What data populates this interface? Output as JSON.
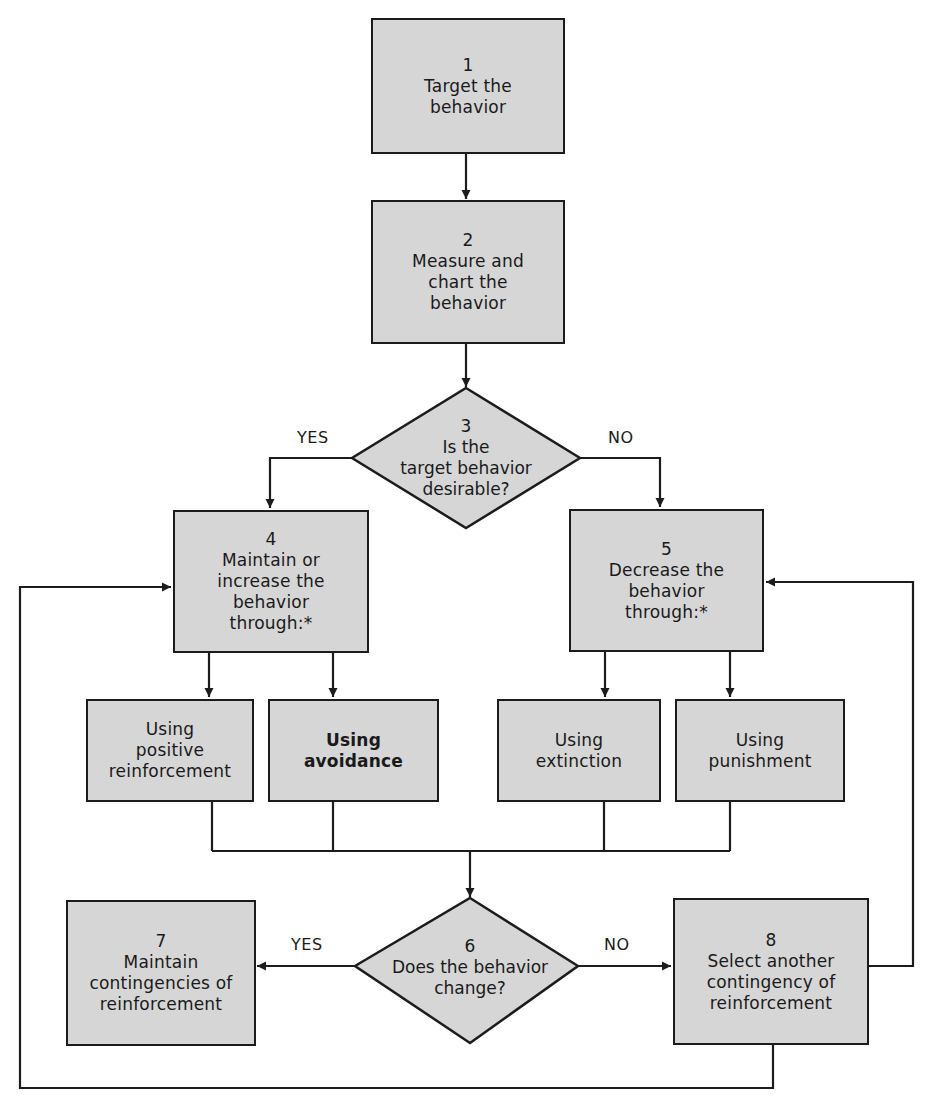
{
  "diagram": {
    "type": "flowchart",
    "colors": {
      "box_fill": "#d6d6d6",
      "stroke": "#1c1c1c",
      "background": "#ffffff"
    },
    "nodes": {
      "n1": {
        "number": "1",
        "label": "Target the\nbehavior",
        "shape": "rectangle"
      },
      "n2": {
        "number": "2",
        "label": "Measure and\nchart the\nbehavior",
        "shape": "rectangle"
      },
      "n3": {
        "number": "3",
        "label": "Is the\ntarget behavior\ndesirable?",
        "shape": "diamond"
      },
      "n4": {
        "number": "4",
        "label": "Maintain or\nincrease the\nbehavior\nthrough:*",
        "shape": "rectangle"
      },
      "n5": {
        "number": "5",
        "label": "Decrease the\nbehavior\nthrough:*",
        "shape": "rectangle"
      },
      "n6": {
        "number": "6",
        "label": "Does the behavior\nchange?",
        "shape": "diamond"
      },
      "n7": {
        "number": "7",
        "label": "Maintain\ncontingencies of\nreinforcement",
        "shape": "rectangle"
      },
      "n8": {
        "number": "8",
        "label": "Select another\ncontingency of\nreinforcement",
        "shape": "rectangle"
      },
      "positive": {
        "label": "Using\npositive\nreinforcement",
        "shape": "rectangle"
      },
      "avoidance": {
        "label": "Using\navoidance",
        "shape": "rectangle"
      },
      "extinction": {
        "label": "Using\nextinction",
        "shape": "rectangle"
      },
      "punishment": {
        "label": "Using\npunishment",
        "shape": "rectangle"
      }
    },
    "edge_labels": {
      "n3_yes": "YES",
      "n3_no": "NO",
      "n6_yes": "YES",
      "n6_no": "NO"
    },
    "edges": [
      {
        "from": "n1",
        "to": "n2"
      },
      {
        "from": "n2",
        "to": "n3"
      },
      {
        "from": "n3",
        "to": "n4",
        "label": "YES"
      },
      {
        "from": "n3",
        "to": "n5",
        "label": "NO"
      },
      {
        "from": "n4",
        "to": "positive"
      },
      {
        "from": "n4",
        "to": "avoidance"
      },
      {
        "from": "n5",
        "to": "extinction"
      },
      {
        "from": "n5",
        "to": "punishment"
      },
      {
        "from": "positive",
        "to": "n6"
      },
      {
        "from": "avoidance",
        "to": "n6"
      },
      {
        "from": "extinction",
        "to": "n6"
      },
      {
        "from": "punishment",
        "to": "n6"
      },
      {
        "from": "n6",
        "to": "n7",
        "label": "YES"
      },
      {
        "from": "n6",
        "to": "n8",
        "label": "NO"
      },
      {
        "from": "n8",
        "to": "n5"
      },
      {
        "from": "n8",
        "to": "n4"
      }
    ]
  }
}
